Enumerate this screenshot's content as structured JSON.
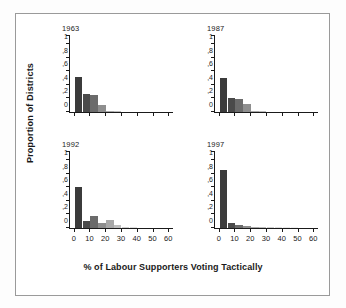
{
  "figure": {
    "xlabel": "% of Labour Supporters Voting Tactically",
    "ylabel": "Proportion of Districts"
  },
  "chart_data": {
    "type": "bar",
    "title": "",
    "xlabel": "% of Labour Supporters Voting Tactically",
    "ylabel": "Proportion of Districts",
    "xlim": [
      -3,
      63
    ],
    "ylim": [
      0,
      1.15
    ],
    "xticks": [
      0,
      10,
      20,
      30,
      40,
      50,
      60
    ],
    "xtick_labels": [
      "0",
      "10",
      "20",
      "30",
      "40",
      "50",
      "60"
    ],
    "yticks": [
      0,
      0.2,
      0.4,
      0.6,
      0.8,
      1.0
    ],
    "ytick_labels": [
      "0",
      ",2",
      ",4",
      ",6",
      ",8",
      "1"
    ],
    "grid": false,
    "legend": "none",
    "bin_width": 5,
    "panels": [
      {
        "label": "1963",
        "bin_starts": [
          0,
          5,
          10,
          15,
          20,
          25,
          30,
          35
        ],
        "values": [
          0.51,
          0.27,
          0.25,
          0.1,
          0.015,
          0.008,
          0.0,
          0.0
        ]
      },
      {
        "label": "1987",
        "bin_starts": [
          0,
          5,
          10,
          15,
          20,
          25,
          30,
          35
        ],
        "values": [
          0.5,
          0.21,
          0.19,
          0.12,
          0.02,
          0.008,
          0.0,
          0.0
        ]
      },
      {
        "label": "1992",
        "bin_starts": [
          0,
          5,
          10,
          15,
          20,
          25,
          30,
          35,
          40
        ],
        "values": [
          0.6,
          0.11,
          0.17,
          0.07,
          0.12,
          0.04,
          0.012,
          0.006,
          0.0
        ]
      },
      {
        "label": "1997",
        "bin_starts": [
          0,
          5,
          10,
          15,
          20,
          25,
          30,
          35,
          40,
          45
        ],
        "values": [
          0.85,
          0.08,
          0.045,
          0.035,
          0.022,
          0.02,
          0.018,
          0.012,
          0.006,
          0.004
        ]
      }
    ],
    "bar_colors": [
      "#3b3b3b",
      "#4a4a4a",
      "#6b6b6b",
      "#8e8e8e",
      "#a8a8a8",
      "#bdbdbd",
      "#d0d0d0",
      "#dedede",
      "#e8e8e8",
      "#efefef"
    ]
  }
}
